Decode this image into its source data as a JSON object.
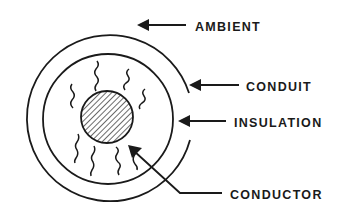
{
  "diagram": {
    "type": "cable cross-section",
    "colors": {
      "stroke": "#1a1a1a",
      "background": "#ffffff"
    },
    "layers": [
      {
        "id": "ambient",
        "label": "AMBIENT"
      },
      {
        "id": "conduit",
        "label": "CONDUIT"
      },
      {
        "id": "insulation",
        "label": "INSULATION"
      },
      {
        "id": "conductor",
        "label": "CONDUCTOR"
      }
    ],
    "heat_lines": 8
  }
}
